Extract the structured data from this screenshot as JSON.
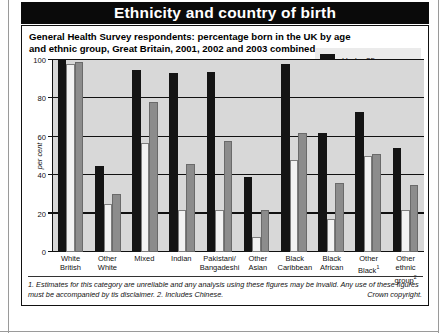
{
  "header": {
    "title": "Ethnicity and country of birth"
  },
  "figure": {
    "subtitle": "General Health Survey respondents: percentage born in the UK by age and ethnic group, Great Britain, 2001, 2002 and 2003 combined.",
    "footnote": "1. Estimates for this category are unreliable and any analysis using these figures may be invalid. Any use of these figures must be accompanied by tis disclaimer. 2. Includes Chinese.",
    "copyright": "Crown copyright."
  },
  "legend": {
    "items": [
      {
        "label": "Under 25",
        "color": "#141414"
      },
      {
        "label": "25 and over",
        "color": "#f4f4f4"
      },
      {
        "label": "Total",
        "color": "#8c8c8c"
      }
    ]
  },
  "axis": {
    "ylabel": "per cent",
    "yticks": [
      "0",
      "20",
      "40",
      "60",
      "80",
      "100"
    ]
  },
  "categories_lines": [
    [
      "White",
      "British"
    ],
    [
      "Other",
      "White"
    ],
    [
      "Mixed",
      ""
    ],
    [
      "Indian",
      ""
    ],
    [
      "Pakistani/",
      "Bangadeshi"
    ],
    [
      "Other",
      "Asian"
    ],
    [
      "Black",
      "Caribbean"
    ],
    [
      "Black",
      "African"
    ],
    [
      "Other",
      "Black¹"
    ],
    [
      "Other",
      "ethnic group²"
    ]
  ],
  "chart_data": {
    "type": "bar",
    "title": "General Health Survey respondents: percentage born in the UK by age and ethnic group, Great Britain, 2001, 2002 and 2003 combined.",
    "xlabel": "",
    "ylabel": "per cent",
    "ylim": [
      0,
      100
    ],
    "ytick_step": 20,
    "grid": true,
    "legend_position": "top-right",
    "categories": [
      "White British",
      "Other White",
      "Mixed",
      "Indian",
      "Pakistani/Bangadeshi",
      "Other Asian",
      "Black Caribbean",
      "Black African",
      "Other Black",
      "Other ethnic group"
    ],
    "series": [
      {
        "name": "Under 25",
        "color": "#141414",
        "values": [
          100,
          45,
          95,
          93,
          94,
          39,
          98,
          62,
          73,
          54
        ]
      },
      {
        "name": "25 and over",
        "color": "#f4f4f4",
        "values": [
          98,
          25,
          57,
          22,
          22,
          8,
          48,
          17,
          50,
          22
        ]
      },
      {
        "name": "Total",
        "color": "#8c8c8c",
        "values": [
          99,
          30,
          78,
          46,
          58,
          22,
          62,
          36,
          51,
          35
        ]
      }
    ]
  }
}
